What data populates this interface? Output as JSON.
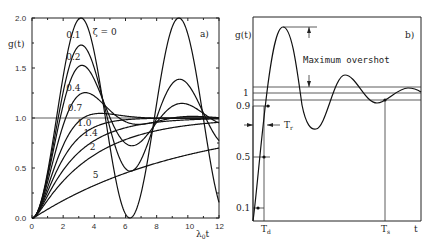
{
  "chart_data": [
    {
      "type": "line",
      "panel_label": "a)",
      "title": "",
      "xlabel": "λ₀t",
      "ylabel": "g(t)",
      "xlim": [
        0,
        12
      ],
      "ylim": [
        0,
        2
      ],
      "x_ticks": [
        "0",
        "2",
        "4",
        "6",
        "8",
        "10",
        "12"
      ],
      "y_ticks": [
        "0.0",
        "0.5",
        "1.0",
        "1.5",
        "2.0"
      ],
      "grid": false,
      "reference_line": 1.0,
      "series_param": "ζ",
      "series": [
        {
          "name": "ζ = 0",
          "zeta": 0,
          "label": "ζ = 0"
        },
        {
          "name": "0.1",
          "zeta": 0.1,
          "label": "0.1"
        },
        {
          "name": "0.2",
          "zeta": 0.2,
          "label": "0.2"
        },
        {
          "name": "0.4",
          "zeta": 0.4,
          "label": "0.4"
        },
        {
          "name": "0.7",
          "zeta": 0.7,
          "label": "0.7"
        },
        {
          "name": "1.0",
          "zeta": 1.0,
          "label": "1.0"
        },
        {
          "name": "1.4",
          "zeta": 1.4,
          "label": "1.4"
        },
        {
          "name": "2",
          "zeta": 2,
          "label": "2"
        },
        {
          "name": "5",
          "zeta": 5,
          "label": "5"
        }
      ],
      "curve_labels": [
        {
          "text": "ζ = 0",
          "x": 3.9,
          "y": 1.83
        },
        {
          "text": "0.1",
          "x": 2.2,
          "y": 1.8
        },
        {
          "text": "0.2",
          "x": 2.2,
          "y": 1.58
        },
        {
          "text": "0.4",
          "x": 2.2,
          "y": 1.27
        },
        {
          "text": "0.7",
          "x": 2.3,
          "y": 1.07
        },
        {
          "text": "1.0",
          "x": 2.9,
          "y": 0.92
        },
        {
          "text": "1.4",
          "x": 3.3,
          "y": 0.82
        },
        {
          "text": "2",
          "x": 3.7,
          "y": 0.68
        },
        {
          "text": "5",
          "x": 3.9,
          "y": 0.4
        }
      ]
    },
    {
      "type": "line",
      "panel_label": "b)",
      "xlabel": "t",
      "ylabel": "g(t)",
      "y_ticks": [
        "0.1",
        "0.5",
        "0.9",
        "1"
      ],
      "annotations": [
        "Maximum overshot",
        "Tr",
        "Td",
        "Ts"
      ],
      "series": [
        {
          "name": "underdamped step response",
          "shape": "damped oscillation settling to 1"
        }
      ]
    }
  ],
  "panel_a": {
    "label": "a)",
    "ylabel": "g(t)",
    "xlabel_main": "λ",
    "xlabel_sub": "0",
    "xlabel_tail": "t",
    "y_ticks": [
      "0.0",
      "0.5",
      "1.0",
      "1.5",
      "2.0"
    ],
    "x_ticks": [
      "0",
      "2",
      "4",
      "6",
      "8",
      "10",
      "12"
    ]
  },
  "panel_b": {
    "label": "b)",
    "ylabel": "g(t)",
    "overshoot_label": "Maximum overshot",
    "tr_main": "T",
    "tr_sub": "r",
    "td_main": "T",
    "td_sub": "d",
    "ts_main": "T",
    "ts_sub": "s",
    "xlabel": "t",
    "y_1": "1",
    "y_09": "0.9",
    "y_05": "0.5",
    "y_01": "0.1"
  }
}
